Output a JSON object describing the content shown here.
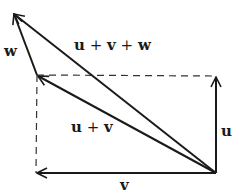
{
  "diagram": {
    "colors": {
      "stroke": "#1a1a1a",
      "dashed": "#333333",
      "background": "#ffffff"
    },
    "points": {
      "origin": [
        216,
        173
      ],
      "u_tip": [
        216,
        76
      ],
      "v_tip": [
        36,
        173
      ],
      "uv_tip": [
        37,
        75
      ],
      "uvw_tip": [
        13,
        13
      ]
    },
    "labels": {
      "u": "u",
      "v": "v",
      "w": "w",
      "u_plus_v": {
        "a": "u",
        "op": "+",
        "b": "v"
      },
      "u_plus_v_plus_w": {
        "a": "u",
        "op1": "+",
        "b": "v",
        "op2": "+",
        "c": "w"
      }
    }
  }
}
